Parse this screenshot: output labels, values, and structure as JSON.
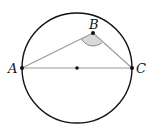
{
  "diagram": {
    "type": "geometry",
    "circle": {
      "cx": 77,
      "cy": 68,
      "r": 55,
      "stroke": "#111111"
    },
    "center_point": {
      "x": 77,
      "y": 68
    },
    "points": {
      "A": {
        "label": "A",
        "x": 22,
        "y": 68
      },
      "B": {
        "label": "B",
        "x": 93,
        "y": 33
      },
      "C": {
        "label": "C",
        "x": 132,
        "y": 68
      }
    },
    "segments": [
      {
        "from": "A",
        "to": "B"
      },
      {
        "from": "B",
        "to": "C"
      },
      {
        "from": "A",
        "to": "C"
      }
    ],
    "angle_marker": {
      "vertex": "B",
      "fill": "#d9d9d9",
      "stroke": "#888888"
    },
    "colors": {
      "segment": "#999999",
      "circle": "#111111",
      "point": "#111111"
    }
  }
}
